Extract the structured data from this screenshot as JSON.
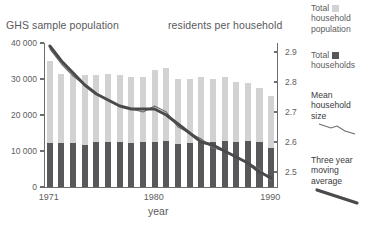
{
  "chart_data": {
    "type": "bar",
    "title": "",
    "xlabel": "year",
    "ylabel": "GHS sample population",
    "y2label": "residents per household",
    "grid": false,
    "legend_position": "right",
    "x": [
      1971,
      1972,
      1973,
      1974,
      1975,
      1976,
      1977,
      1978,
      1979,
      1980,
      1981,
      1982,
      1983,
      1984,
      1985,
      1986,
      1987,
      1988,
      1989,
      1990
    ],
    "categories": [
      "1971",
      "1972",
      "1973",
      "1974",
      "1975",
      "1976",
      "1977",
      "1978",
      "1979",
      "1980",
      "1981",
      "1982",
      "1983",
      "1984",
      "1985",
      "1986",
      "1987",
      "1988",
      "1989",
      "1990"
    ],
    "xtick_labels": [
      "1971",
      "1980",
      "1990"
    ],
    "xtick_values": [
      1971,
      1980,
      1990
    ],
    "ylim": [
      0,
      40000
    ],
    "ytick_values": [
      0,
      10000,
      20000,
      30000,
      40000
    ],
    "ytick_labels": [
      "0",
      "10 000",
      "20 000",
      "30 000",
      "40 000"
    ],
    "y2lim": [
      2.45,
      2.93
    ],
    "y2tick_values": [
      2.5,
      2.6,
      2.7,
      2.8,
      2.9
    ],
    "y2tick_labels": [
      "2.5",
      "2.6",
      "2.7",
      "2.8",
      "2.9"
    ],
    "series": [
      {
        "name": "Total household population",
        "type": "bar",
        "axis": "left",
        "color": "#d2d2d2",
        "values": [
          34900,
          31400,
          31200,
          31200,
          31100,
          31400,
          31100,
          30600,
          30500,
          32600,
          33100,
          30000,
          29900,
          30500,
          29900,
          30600,
          29100,
          29000,
          27400,
          25200
        ]
      },
      {
        "name": "Total households",
        "type": "bar",
        "axis": "left",
        "color": "#58585a",
        "values": [
          12300,
          12300,
          12300,
          11800,
          12400,
          12600,
          12500,
          12200,
          12400,
          12400,
          12700,
          11900,
          12100,
          12500,
          12400,
          12900,
          12600,
          12700,
          12400,
          10900
        ]
      },
      {
        "name": "Mean household size",
        "type": "line",
        "axis": "right",
        "color": "#6b6b6e",
        "values": [
          2.91,
          2.86,
          2.82,
          2.79,
          2.76,
          2.74,
          2.72,
          2.71,
          2.7,
          2.72,
          2.7,
          2.65,
          2.63,
          2.61,
          2.58,
          2.57,
          2.55,
          2.53,
          2.51,
          2.47
        ]
      },
      {
        "name": "Three year moving average",
        "type": "line",
        "axis": "right",
        "color": "#4a4a4c",
        "values": [
          2.92,
          2.87,
          2.83,
          2.79,
          2.76,
          2.74,
          2.72,
          2.71,
          2.71,
          2.71,
          2.69,
          2.66,
          2.63,
          2.6,
          2.59,
          2.57,
          2.55,
          2.53,
          2.5,
          2.48
        ]
      }
    ]
  },
  "titles": {
    "left_axis": "GHS sample population",
    "right_axis": "residents per household",
    "x_axis": "year"
  },
  "legend": {
    "items": [
      {
        "label_line1": "Total",
        "label_line2": "household",
        "label_line3": "population",
        "marker": "swatch-light",
        "color": "#d2d2d2"
      },
      {
        "label_line1": "Total",
        "label_line2": "households",
        "label_line3": "",
        "marker": "swatch-dark",
        "color": "#58585a"
      },
      {
        "label_line1": "Mean",
        "label_line2": "household",
        "label_line3": "size",
        "marker": "thin-line",
        "color": "#6b6b6e"
      },
      {
        "label_line1": "Three year",
        "label_line2": "moving",
        "label_line3": "average",
        "marker": "thick-line",
        "color": "#4a4a4c"
      }
    ]
  }
}
